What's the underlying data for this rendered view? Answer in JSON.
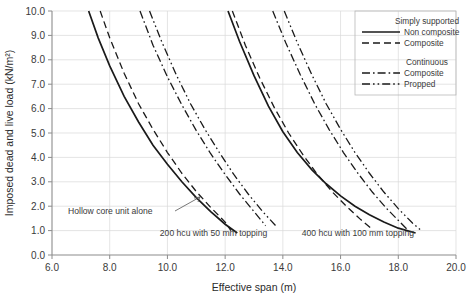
{
  "chart_data": {
    "type": "line",
    "title": "",
    "xlabel": "Effective span (m)",
    "ylabel": "Imposed dead and live load (kN/m²)",
    "xlim": [
      6.0,
      20.0
    ],
    "ylim": [
      0.0,
      10.0
    ],
    "xticks": [
      "6.0",
      "8.0",
      "10.0",
      "12.0",
      "14.0",
      "16.0",
      "18.0",
      "20.0"
    ],
    "yticks": [
      "0.0",
      "1.0",
      "2.0",
      "3.0",
      "4.0",
      "5.0",
      "6.0",
      "7.0",
      "8.0",
      "9.0",
      "10.0"
    ],
    "grid": true,
    "legend_position": "top-right",
    "legend": {
      "group1_title": "Simply supported",
      "group1_items": [
        {
          "label": "Non composite",
          "style": "solid"
        },
        {
          "label": "Composite",
          "style": "dashed"
        }
      ],
      "group2_title": "Continuous",
      "group2_items": [
        {
          "label": "Composite",
          "style": "dash-dot"
        },
        {
          "label": "Propped",
          "style": "dash-dot-dot"
        }
      ]
    },
    "annotations": [
      {
        "text": "Hollow core unit alone",
        "x": 9.0,
        "y": 2.0
      },
      {
        "text": "200 hcu with 50 mm topping",
        "x": 11.6,
        "y": 0.95
      },
      {
        "text": "400 hcu with 100 mm topping",
        "x": 16.6,
        "y": 0.95
      }
    ],
    "series": [
      {
        "name": "200 hcu – Simply supported, Non composite",
        "group": "200 hcu with 50 mm topping",
        "style": "solid",
        "points": [
          [
            7.27,
            10.0
          ],
          [
            7.6,
            8.9
          ],
          [
            8.0,
            7.75
          ],
          [
            8.5,
            6.5
          ],
          [
            9.0,
            5.45
          ],
          [
            9.5,
            4.5
          ],
          [
            10.0,
            3.72
          ],
          [
            10.5,
            3.0
          ],
          [
            11.0,
            2.35
          ],
          [
            11.5,
            1.78
          ],
          [
            12.0,
            1.26
          ],
          [
            12.42,
            0.9
          ]
        ]
      },
      {
        "name": "200 hcu – Simply supported, Composite",
        "group": "200 hcu with 50 mm topping",
        "style": "dashed",
        "points": [
          [
            7.67,
            10.0
          ],
          [
            8.0,
            8.9
          ],
          [
            8.5,
            7.45
          ],
          [
            9.0,
            6.2
          ],
          [
            9.5,
            5.15
          ],
          [
            10.0,
            4.2
          ],
          [
            10.5,
            3.35
          ],
          [
            11.0,
            2.6
          ],
          [
            11.5,
            1.95
          ],
          [
            12.0,
            1.35
          ],
          [
            12.2,
            1.0
          ]
        ]
      },
      {
        "name": "200 hcu – Continuous, Composite",
        "group": "200 hcu with 50 mm topping",
        "style": "dash-dot",
        "points": [
          [
            9.05,
            10.0
          ],
          [
            9.5,
            8.6
          ],
          [
            10.0,
            7.3
          ],
          [
            10.5,
            6.15
          ],
          [
            11.0,
            5.1
          ],
          [
            11.5,
            4.15
          ],
          [
            12.0,
            3.3
          ],
          [
            12.5,
            2.5
          ],
          [
            13.0,
            1.78
          ],
          [
            13.4,
            1.2
          ]
        ]
      },
      {
        "name": "200 hcu – Continuous, Propped",
        "group": "200 hcu with 50 mm topping",
        "style": "dash-dot-dot",
        "points": [
          [
            9.38,
            10.0
          ],
          [
            9.8,
            8.75
          ],
          [
            10.3,
            7.4
          ],
          [
            10.8,
            6.2
          ],
          [
            11.3,
            5.15
          ],
          [
            11.8,
            4.2
          ],
          [
            12.3,
            3.3
          ],
          [
            12.8,
            2.5
          ],
          [
            13.3,
            1.78
          ],
          [
            13.75,
            1.2
          ]
        ]
      },
      {
        "name": "400 hcu – Simply supported, Non composite",
        "group": "400 hcu with 100 mm topping",
        "style": "solid",
        "points": [
          [
            12.1,
            10.0
          ],
          [
            12.5,
            8.75
          ],
          [
            13.0,
            7.35
          ],
          [
            13.5,
            6.1
          ],
          [
            14.0,
            5.05
          ],
          [
            14.5,
            4.2
          ],
          [
            15.0,
            3.5
          ],
          [
            15.5,
            2.92
          ],
          [
            16.0,
            2.42
          ],
          [
            16.5,
            2.0
          ],
          [
            17.0,
            1.65
          ],
          [
            17.5,
            1.35
          ],
          [
            18.0,
            1.1
          ],
          [
            18.6,
            0.9
          ]
        ]
      },
      {
        "name": "400 hcu – Simply supported, Composite",
        "group": "400 hcu with 100 mm topping",
        "style": "dashed",
        "points": [
          [
            12.25,
            10.0
          ],
          [
            12.7,
            8.6
          ],
          [
            13.2,
            7.25
          ],
          [
            13.7,
            6.05
          ],
          [
            14.2,
            5.0
          ],
          [
            14.7,
            4.1
          ],
          [
            15.2,
            3.3
          ],
          [
            15.7,
            2.6
          ],
          [
            16.2,
            2.0
          ],
          [
            16.7,
            1.45
          ],
          [
            17.1,
            1.05
          ]
        ]
      },
      {
        "name": "400 hcu – Continuous, Composite",
        "group": "400 hcu with 100 mm topping",
        "style": "dash-dot",
        "points": [
          [
            13.65,
            10.0
          ],
          [
            14.1,
            8.7
          ],
          [
            14.6,
            7.4
          ],
          [
            15.1,
            6.2
          ],
          [
            15.6,
            5.15
          ],
          [
            16.1,
            4.2
          ],
          [
            16.6,
            3.35
          ],
          [
            17.1,
            2.58
          ],
          [
            17.6,
            1.9
          ],
          [
            18.1,
            1.3
          ],
          [
            18.35,
            1.0
          ]
        ]
      },
      {
        "name": "400 hcu – Continuous, Propped",
        "group": "400 hcu with 100 mm topping",
        "style": "dash-dot-dot",
        "points": [
          [
            14.05,
            10.0
          ],
          [
            14.5,
            8.7
          ],
          [
            15.0,
            7.4
          ],
          [
            15.5,
            6.2
          ],
          [
            16.0,
            5.15
          ],
          [
            16.5,
            4.2
          ],
          [
            17.0,
            3.35
          ],
          [
            17.5,
            2.58
          ],
          [
            18.0,
            1.9
          ],
          [
            18.5,
            1.3
          ],
          [
            18.8,
            1.0
          ]
        ]
      }
    ]
  }
}
